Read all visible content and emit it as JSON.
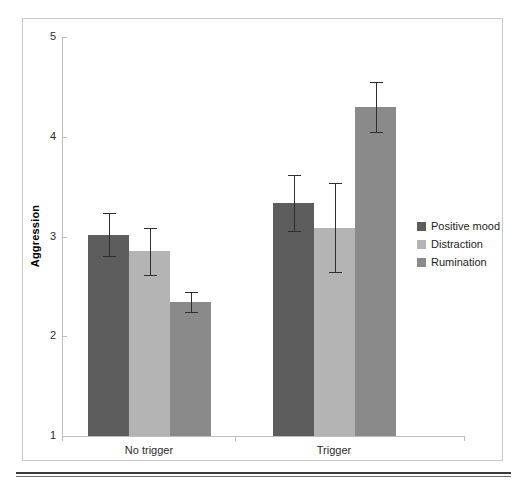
{
  "chart_data": {
    "type": "bar",
    "title": "",
    "xlabel": "",
    "ylabel": "Aggression",
    "ylim": [
      1,
      5
    ],
    "yticks": [
      "1",
      "2",
      "3",
      "4",
      "5"
    ],
    "categories": [
      "No trigger",
      "Trigger"
    ],
    "grid": false,
    "legend_position": "right",
    "series": [
      {
        "name": "Positive mood",
        "color": "#5d5d5d",
        "values": [
          3.02,
          3.34
        ],
        "errors": [
          0.22,
          0.28
        ]
      },
      {
        "name": "Distraction",
        "color": "#b4b4b4",
        "values": [
          2.85,
          3.09
        ],
        "errors": [
          0.24,
          0.45
        ]
      },
      {
        "name": "Rumination",
        "color": "#8a8a8a",
        "values": [
          2.34,
          4.3
        ],
        "errors": [
          0.1,
          0.25
        ]
      }
    ]
  },
  "axis": {
    "y_label": "Aggression",
    "y_tick_labels": [
      "5",
      "4",
      "3",
      "2",
      "1"
    ],
    "x_tick_labels": [
      "No trigger",
      "Trigger"
    ]
  },
  "legend": {
    "items": [
      {
        "label": "Positive mood",
        "color": "#5d5d5d"
      },
      {
        "label": "Distraction",
        "color": "#b4b4b4"
      },
      {
        "label": "Rumination",
        "color": "#8a8a8a"
      }
    ]
  },
  "colors": {
    "positive_mood": "#5d5d5d",
    "distraction": "#b4b4b4",
    "rumination": "#8a8a8a",
    "axis": "#bdbdbd",
    "error_bar": "#2e2e2e",
    "frame": "#c9c9c9",
    "rule": "#3a3a3a"
  }
}
